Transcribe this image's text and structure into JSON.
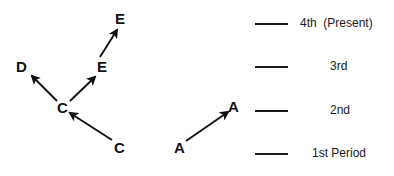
{
  "figure": {
    "background_color": "#ffffff",
    "ink_color": "#111111",
    "width": 394,
    "height": 176
  },
  "diagram": {
    "nodes": [
      {
        "id": "node-e-top",
        "label": "E",
        "x": 115,
        "y": 11
      },
      {
        "id": "node-e-mid",
        "label": "E",
        "x": 97,
        "y": 59
      },
      {
        "id": "node-d",
        "label": "D",
        "x": 16,
        "y": 59
      },
      {
        "id": "node-c-mid",
        "label": "C",
        "x": 57,
        "y": 100
      },
      {
        "id": "node-c-bottom",
        "label": "C",
        "x": 114,
        "y": 140
      },
      {
        "id": "node-a-top",
        "label": "A",
        "x": 228,
        "y": 99
      },
      {
        "id": "node-a-bottom",
        "label": "A",
        "x": 174,
        "y": 140
      }
    ],
    "arrows": [
      {
        "id": "arrow-c-to-d",
        "from": "node-c-mid",
        "to": "node-d",
        "x1": 57,
        "y1": 101,
        "x2": 32,
        "y2": 76
      },
      {
        "id": "arrow-c-to-e",
        "from": "node-c-mid",
        "to": "node-e-mid",
        "x1": 70,
        "y1": 101,
        "x2": 95,
        "y2": 77
      },
      {
        "id": "arrow-e-to-e",
        "from": "node-e-mid",
        "to": "node-e-top",
        "x1": 100,
        "y1": 57,
        "x2": 117,
        "y2": 30
      },
      {
        "id": "arrow-c-bottom-to-c",
        "from": "node-c-bottom",
        "to": "node-c-mid",
        "x1": 112,
        "y1": 140,
        "x2": 70,
        "y2": 113
      },
      {
        "id": "arrow-a-to-a",
        "from": "node-a-bottom",
        "to": "node-a-top",
        "x1": 186,
        "y1": 141,
        "x2": 228,
        "y2": 112
      }
    ]
  },
  "legend": {
    "entries": [
      {
        "id": "legend-4th",
        "label": "4th  (Present)",
        "rule_x": 255,
        "rule_y": 23,
        "rule_width": 33,
        "text_x": 300,
        "text_y": 17
      },
      {
        "id": "legend-3rd",
        "label": "3rd",
        "rule_x": 255,
        "rule_y": 66,
        "rule_width": 33,
        "text_x": 330,
        "text_y": 60
      },
      {
        "id": "legend-2nd",
        "label": "2nd",
        "rule_x": 255,
        "rule_y": 110,
        "rule_width": 33,
        "text_x": 330,
        "text_y": 104
      },
      {
        "id": "legend-1st",
        "label": "1st Period",
        "rule_x": 255,
        "rule_y": 153,
        "rule_width": 33,
        "text_x": 312,
        "text_y": 147
      }
    ]
  }
}
